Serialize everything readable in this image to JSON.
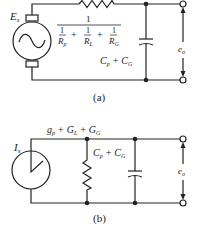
{
  "figure_a": {
    "caption": "(a)",
    "source_label": "E",
    "source_sub": "s",
    "resistor_numerator": "1",
    "terms": [
      {
        "num": "1",
        "den": "R",
        "sub": "p"
      },
      {
        "num": "1",
        "den": "R",
        "sub": "L"
      },
      {
        "num": "1",
        "den": "R",
        "sub": "G"
      }
    ],
    "plus": "+",
    "capacitance_label": {
      "c1": "C",
      "s1": "p",
      "op": "+",
      "c2": "C",
      "s2": "G"
    },
    "output_label": "e",
    "output_sub": "o"
  },
  "figure_b": {
    "caption": "(b)",
    "source_label": "I",
    "source_sub": "s",
    "conductance_label": {
      "t1": "g",
      "s1": "p",
      "op1": "+",
      "t2": "G",
      "s2": "L",
      "op2": "+",
      "t3": "G",
      "s3": "G"
    },
    "capacitance_label": {
      "c1": "C",
      "s1": "p",
      "op": "+",
      "c2": "C",
      "s2": "G"
    },
    "output_label": "e",
    "output_sub": "o"
  },
  "colors": {
    "ink": "#222222",
    "background": "#ffffff"
  }
}
